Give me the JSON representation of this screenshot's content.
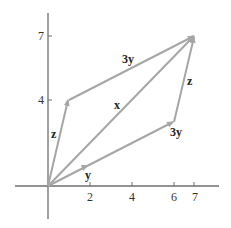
{
  "diagram": {
    "type": "vector-parallelogram",
    "colors": {
      "axis": "#6e6e6e",
      "vectors": "#a6a6a6",
      "labels": "#222222"
    },
    "axes": {
      "x_ticks": [
        {
          "value": 2,
          "label": "2"
        },
        {
          "value": 4,
          "label": "4"
        },
        {
          "value": 6,
          "label": "6"
        },
        {
          "value": 7,
          "label": "7"
        }
      ],
      "y_ticks": [
        {
          "value": 4,
          "label": "4"
        },
        {
          "value": 7,
          "label": "7"
        }
      ]
    },
    "vectors": [
      {
        "id": "y",
        "from": [
          0,
          0
        ],
        "to": [
          2,
          1
        ],
        "label": "y"
      },
      {
        "id": "3y-lower",
        "from": [
          0,
          0
        ],
        "to": [
          6,
          3
        ],
        "label": "3y"
      },
      {
        "id": "z-lower",
        "from": [
          6,
          3
        ],
        "to": [
          7,
          7
        ],
        "label": "z"
      },
      {
        "id": "z-left",
        "from": [
          0,
          0
        ],
        "to": [
          1,
          4
        ],
        "label": "z"
      },
      {
        "id": "3y-upper",
        "from": [
          1,
          4
        ],
        "to": [
          7,
          7
        ],
        "label": "3y"
      },
      {
        "id": "x",
        "from": [
          0,
          0
        ],
        "to": [
          7,
          7
        ],
        "label": "x"
      }
    ]
  }
}
